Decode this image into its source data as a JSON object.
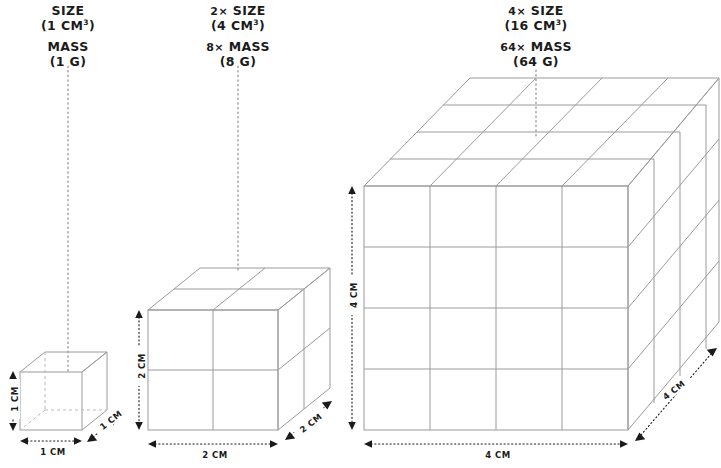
{
  "diagram": {
    "title_semantic": "surface-area-to-volume cube scaling diagram",
    "background": "#ffffff",
    "stroke_color": "#9a9a9a",
    "text_color": "#1b1b1b"
  },
  "cubes": [
    {
      "id": "small",
      "size_label_prefix": "",
      "size_label": "SIZE",
      "volume_text": "(1 CM",
      "volume_sup": "3",
      "volume_close": ")",
      "mass_prefix": "",
      "mass_label": "MASS",
      "mass_value": "(1 G)",
      "edge_units": 1,
      "width_dim": "1 CM",
      "height_dim": "1 CM",
      "depth_dim": "1 CM",
      "hidden_edges": true
    },
    {
      "id": "medium",
      "size_label_prefix": "2×",
      "size_label": "SIZE",
      "volume_text": "(4 CM",
      "volume_sup": "3",
      "volume_close": ")",
      "mass_prefix": "8×",
      "mass_label": "MASS",
      "mass_value": "(8 G)",
      "edge_units": 2,
      "width_dim": "2 CM",
      "height_dim": "2 CM",
      "depth_dim": "2 CM",
      "hidden_edges": false
    },
    {
      "id": "large",
      "size_label_prefix": "4×",
      "size_label": "SIZE",
      "volume_text": "(16 CM",
      "volume_sup": "3",
      "volume_close": ")",
      "mass_prefix": "64×",
      "mass_label": "MASS",
      "mass_value": "(64 G)",
      "edge_units": 4,
      "width_dim": "4 CM",
      "height_dim": "4 CM",
      "depth_dim": "4 CM",
      "hidden_edges": false
    }
  ]
}
